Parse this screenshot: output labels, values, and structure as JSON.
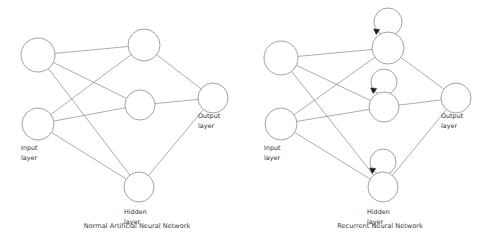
{
  "figure": {
    "background": "#ffffff",
    "line_color": "#8a8a8a",
    "arrow_color": "#1a1a1a",
    "text_color": "#333333"
  },
  "diagrams": [
    {
      "id": "normal-ann",
      "caption": "Normal Artificial Neural Network",
      "caption_x": 137,
      "caption_y": 228,
      "recurrent": false,
      "labels": {
        "input_line1": "Input",
        "input_line2": "layer",
        "hidden_line1": "Hidden",
        "hidden_line2": "layer",
        "output_line1": "Output",
        "output_line2": "layer"
      },
      "label_positions": {
        "input": {
          "x": 21,
          "y": 150
        },
        "hidden": {
          "x": 124,
          "y": 214
        },
        "output": {
          "x": 198,
          "y": 118
        }
      },
      "nodes": [
        {
          "name": "input-node-1",
          "cx": 38,
          "cy": 55,
          "r": 17,
          "layer": "input"
        },
        {
          "name": "input-node-2",
          "cx": 38,
          "cy": 124,
          "r": 16,
          "layer": "input"
        },
        {
          "name": "hidden-node-1",
          "cx": 144,
          "cy": 45,
          "r": 16,
          "layer": "hidden"
        },
        {
          "name": "hidden-node-2",
          "cx": 140,
          "cy": 105,
          "r": 15,
          "layer": "hidden"
        },
        {
          "name": "hidden-node-3",
          "cx": 139,
          "cy": 187,
          "r": 15,
          "layer": "hidden"
        },
        {
          "name": "output-node-1",
          "cx": 213,
          "cy": 98,
          "r": 15,
          "layer": "output"
        }
      ],
      "edges": [
        {
          "from": "input-node-1",
          "to": "hidden-node-1"
        },
        {
          "from": "input-node-1",
          "to": "hidden-node-2"
        },
        {
          "from": "input-node-1",
          "to": "hidden-node-3"
        },
        {
          "from": "input-node-2",
          "to": "hidden-node-1"
        },
        {
          "from": "input-node-2",
          "to": "hidden-node-2"
        },
        {
          "from": "input-node-2",
          "to": "hidden-node-3"
        },
        {
          "from": "hidden-node-1",
          "to": "output-node-1"
        },
        {
          "from": "hidden-node-2",
          "to": "output-node-1"
        },
        {
          "from": "hidden-node-3",
          "to": "output-node-1"
        }
      ],
      "self_loops": []
    },
    {
      "id": "recurrent-nn",
      "caption": "Recurrent Neural Network",
      "caption_x": 137,
      "caption_y": 228,
      "recurrent": true,
      "labels": {
        "input_line1": "Input",
        "input_line2": "layer",
        "hidden_line1": "Hidden",
        "hidden_line2": "layer",
        "output_line1": "Output",
        "output_line2": "layer"
      },
      "label_positions": {
        "input": {
          "x": 21,
          "y": 150
        },
        "hidden": {
          "x": 124,
          "y": 214
        },
        "output": {
          "x": 198,
          "y": 118
        }
      },
      "nodes": [
        {
          "name": "input-node-1",
          "cx": 38,
          "cy": 58,
          "r": 17,
          "layer": "input"
        },
        {
          "name": "input-node-2",
          "cx": 38,
          "cy": 124,
          "r": 16,
          "layer": "input"
        },
        {
          "name": "hidden-node-1",
          "cx": 145,
          "cy": 48,
          "r": 16,
          "layer": "hidden"
        },
        {
          "name": "hidden-node-2",
          "cx": 141,
          "cy": 107,
          "r": 15,
          "layer": "hidden"
        },
        {
          "name": "hidden-node-3",
          "cx": 140,
          "cy": 187,
          "r": 15,
          "layer": "hidden"
        },
        {
          "name": "output-node-1",
          "cx": 213,
          "cy": 98,
          "r": 15,
          "layer": "output"
        }
      ],
      "edges": [
        {
          "from": "input-node-1",
          "to": "hidden-node-1"
        },
        {
          "from": "input-node-1",
          "to": "hidden-node-2"
        },
        {
          "from": "input-node-1",
          "to": "hidden-node-3"
        },
        {
          "from": "input-node-2",
          "to": "hidden-node-1"
        },
        {
          "from": "input-node-2",
          "to": "hidden-node-2"
        },
        {
          "from": "input-node-2",
          "to": "hidden-node-3"
        },
        {
          "from": "hidden-node-1",
          "to": "output-node-1"
        },
        {
          "from": "hidden-node-2",
          "to": "output-node-1"
        },
        {
          "from": "hidden-node-3",
          "to": "output-node-1"
        }
      ],
      "self_loops": [
        {
          "name": "self-loop-hidden-1",
          "cx": 145,
          "cy": 22,
          "r": 14,
          "arrow_x": 135,
          "arrow_y": 32,
          "arrow_angle": 215
        },
        {
          "name": "self-loop-hidden-2",
          "cx": 141,
          "cy": 82,
          "r": 13,
          "arrow_x": 132,
          "arrow_y": 91,
          "arrow_angle": 215
        },
        {
          "name": "self-loop-hidden-3",
          "cx": 140,
          "cy": 162,
          "r": 13,
          "arrow_x": 131,
          "arrow_y": 171,
          "arrow_angle": 215
        }
      ]
    }
  ]
}
